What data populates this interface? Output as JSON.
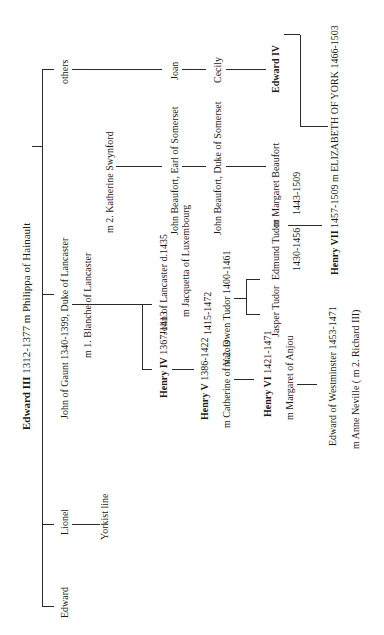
{
  "title": {
    "name": "Edward III",
    "dates": "1312-1377",
    "spouse": "m Philippa of Hainault"
  },
  "gen1": {
    "edward": "Edward",
    "lionel": "Lionel",
    "yorkist": "Yorkist line",
    "gaunt": "John of Gaunt  1340-1399, Duke of Lancaster",
    "gaunt_m1": "m 1. Blanche of Lancaster",
    "gaunt_m2": "m 2. Katherine Swynford",
    "others": "others"
  },
  "lancaster": {
    "henry4_name": "Henry IV",
    "henry4_dates": "1367-1413",
    "john_lancaster": "John of Lancaster d.1435",
    "jacquetta": "m Jacquetta of Luxembourg",
    "jacquetta_dates": "1415-1472",
    "henry5_name": "Henry V",
    "henry5_dates": "1386-1422",
    "catherine": "m Catherine of Valois",
    "owen": "m 2. Owen Tudor 1400-1461",
    "henry6_name": "Henry VI",
    "henry6_dates": "1421-1471",
    "margaret_anjou": "m Margaret of Anjou",
    "edward_westminster": "Edward of Westminster 1453-1471",
    "anne_neville": "m Anne Neville  ( m 2. Richard III)"
  },
  "beaufort": {
    "john_earl": "John Beaufort, Earl of Somerset",
    "john_duke": "John Beaufort, Duke of Somerset",
    "joan": "Joan",
    "cecily": "Cecily",
    "edward4": "Edward IV"
  },
  "tudor": {
    "jasper": "Jasper Tudor",
    "edmund": "Edmund Tudor",
    "edmund_dates": "1430-1456",
    "margaret_beaufort": "m Margaret Beaufort",
    "margaret_dates": "1443-1509",
    "henry7_name": "Henry VII",
    "henry7_dates": "1457-1509",
    "henry7_spouse": "m  ELIZABETH OF YORK 1466-1503"
  }
}
